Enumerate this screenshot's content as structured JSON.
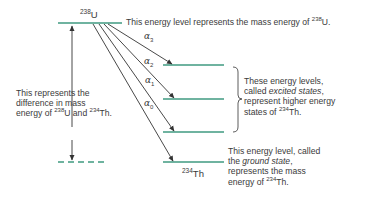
{
  "diagram": {
    "type": "nuclear-energy-level-diagram",
    "colors": {
      "level": "#3f9a80",
      "arrow": "#333333",
      "text": "#3a3a3a"
    },
    "parent": {
      "mass_number": "238",
      "symbol": "U"
    },
    "daughter": {
      "mass_number": "234",
      "symbol": "Th"
    },
    "transitions": [
      {
        "label": "α",
        "sub": "3"
      },
      {
        "label": "α",
        "sub": "2"
      },
      {
        "label": "α",
        "sub": "1"
      },
      {
        "label": "α",
        "sub": "0"
      }
    ],
    "annotations": {
      "top": {
        "pre": "This energy level represents the mass energy of ",
        "sup": "238",
        "post": "U."
      },
      "left": {
        "line1": "This represents the",
        "line2": "difference in mass",
        "line3_pre": "energy of ",
        "line3_sup1": "238",
        "line3_mid": "U and ",
        "line3_sup2": "234",
        "line3_post": "Th."
      },
      "excited": {
        "line1": "These energy levels,",
        "line2_pre": "called ",
        "line2_italic": "excited states",
        "line2_post": ",",
        "line3": "represent higher energy",
        "line4_pre": "states of ",
        "line4_sup": "234",
        "line4_post": "Th."
      },
      "ground": {
        "line1": "This energy level, called",
        "line2_pre": "the ",
        "line2_italic": "ground state",
        "line2_post": ",",
        "line3": "represents the mass",
        "line4_pre": "energy of ",
        "line4_sup": "234",
        "line4_post": "Th."
      }
    }
  }
}
